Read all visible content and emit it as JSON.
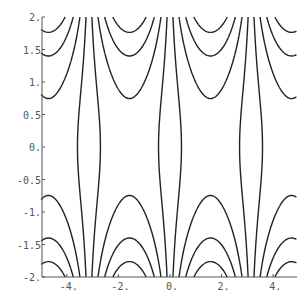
{
  "chart_data": {
    "type": "contour",
    "function": "sin(x) * cosh(y)",
    "title": "",
    "xlabel": "",
    "ylabel": "",
    "xlim": [
      -5.0,
      4.9
    ],
    "ylim": [
      -2,
      2
    ],
    "x_ticks": [
      {
        "value": -4,
        "label": "-4."
      },
      {
        "value": -2,
        "label": "-2."
      },
      {
        "value": 0,
        "label": "0."
      },
      {
        "value": 2,
        "label": "2."
      },
      {
        "value": 4,
        "label": "4."
      }
    ],
    "y_ticks": [
      {
        "value": 2,
        "label": "2."
      },
      {
        "value": 1.5,
        "label": "1.5"
      },
      {
        "value": 1,
        "label": "1."
      },
      {
        "value": 0.5,
        "label": "0.5"
      },
      {
        "value": 0,
        "label": "0."
      },
      {
        "value": -0.5,
        "label": "-0.5"
      },
      {
        "value": -1,
        "label": "-1."
      },
      {
        "value": -1.5,
        "label": "-1.5"
      },
      {
        "value": -2,
        "label": "-2."
      }
    ],
    "contour_levels": [
      -3.0,
      -2.15,
      -1.29,
      -0.43,
      0.43,
      1.29,
      2.15,
      3.0
    ],
    "grid": false,
    "legend": null,
    "line_color": "#222222",
    "axis_color": "#555555"
  }
}
